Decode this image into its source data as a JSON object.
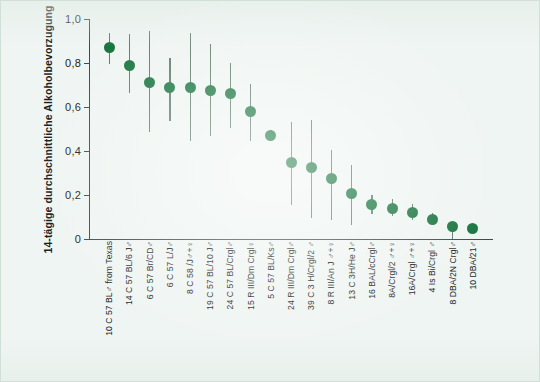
{
  "chart_data": {
    "type": "scatter",
    "title": "",
    "xlabel": "",
    "ylabel": "14-tägige durchschnittliche Alkoholbevorzugung",
    "ylim": [
      0,
      1.0
    ],
    "ytick_labels": [
      "0",
      "0,2",
      "0,4",
      "0,6",
      "0,8",
      "1,0"
    ],
    "ytick_values": [
      0,
      0.2,
      0.4,
      0.6,
      0.8,
      1.0
    ],
    "grid": false,
    "legend": "none",
    "error_bars": "vertical range bars",
    "marker_color": "#15733c",
    "errorbar_color": "#5c7a6a",
    "background_color": "#eff5f2",
    "axis_color": "#3f4a45",
    "categories": [
      "10 C 57 BL♂ from Texas",
      "14 C 57 BL/6 J♂",
      "6 C 57 Br/CD♂",
      "6 C 57 L/J♂",
      "8 C 58 /J♂+♀",
      "19 C 57 BL/10 J♂",
      "24 C 57 BL/Crgl♂",
      "15 R III/Dm Crgl♀",
      "5 C 57 BL/Ks♂",
      "24 R III/Dm Crgl♂",
      "39 C 3 H/Crgl/2 ♂",
      "8 R III/An J ♂+♀",
      "13 C 3H/He J♂",
      "16 BAL/cCrgl♂",
      "8A/Crgl/2 ♂+♀",
      "16A/Crgl ♂+♀",
      "4 Is Bi/Crgl ♂",
      "8 DBA/2N Crgl♂",
      "10 DBA/21♂"
    ],
    "values": [
      0.87,
      0.79,
      0.71,
      0.69,
      0.69,
      0.675,
      0.66,
      0.58,
      0.47,
      0.35,
      0.325,
      0.275,
      0.205,
      0.155,
      0.14,
      0.12,
      0.09,
      0.055,
      0.05
    ],
    "err_low": [
      0.795,
      0.665,
      0.485,
      0.535,
      0.445,
      0.47,
      0.505,
      0.445,
      0.445,
      0.155,
      0.095,
      0.085,
      0.065,
      0.115,
      0.105,
      0.085,
      0.065,
      0.0,
      0.03
    ],
    "err_high": [
      0.935,
      0.93,
      0.945,
      0.825,
      0.935,
      0.885,
      0.8,
      0.705,
      0.495,
      0.53,
      0.54,
      0.405,
      0.335,
      0.2,
      0.18,
      0.16,
      0.12,
      0.08,
      0.07
    ]
  }
}
